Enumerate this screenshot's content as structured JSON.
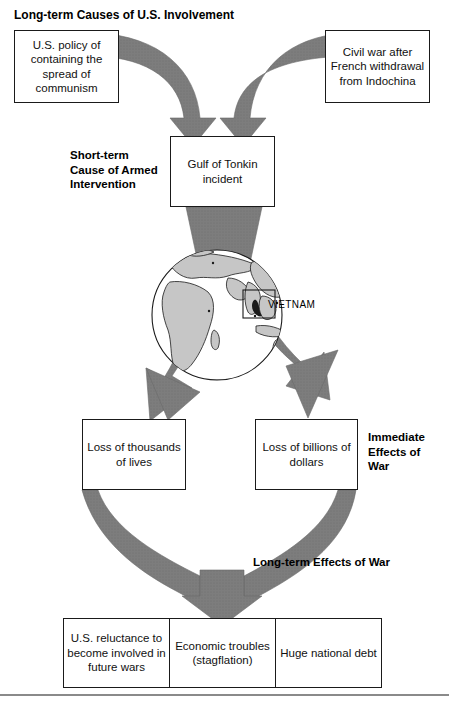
{
  "diagram": {
    "title": "Long-term Causes of U.S. Involvement",
    "section_labels": {
      "short_term_cause": "Short-term\nCause of Armed\nIntervention",
      "immediate_effects": "Immediate\nEffects of\nWar",
      "long_term_effects": "Long-term Effects of War"
    },
    "causes": [
      {
        "id": "cause-left",
        "text": "U.S. policy of containing the spread of communism"
      },
      {
        "id": "cause-right",
        "text": "Civil war after French withdrawal from Indochina"
      }
    ],
    "short_term_cause_box": {
      "id": "gulf-of-tonkin",
      "text": "Gulf of Tonkin incident"
    },
    "globe": {
      "region_label": "VIETNAM",
      "ocean_color": "#ffffff",
      "land_color": "#c6c6c6",
      "outline_color": "#1a1a1a"
    },
    "immediate_effects": [
      {
        "id": "loss-of-lives",
        "text": "Loss of thousands of lives"
      },
      {
        "id": "loss-of-dollars",
        "text": "Loss of billions of dollars"
      }
    ],
    "long_term_effects": [
      {
        "id": "effect-reluctance",
        "text": "U.S. reluctance to become involved in future wars"
      },
      {
        "id": "effect-economy",
        "text": "Economic troubles (stagflation)"
      },
      {
        "id": "effect-debt",
        "text": "Huge national debt"
      }
    ],
    "colors": {
      "arrow_fill": "#7d7d7d",
      "arrow_stroke": "#6a6a6a",
      "box_border": "#1a1a1a",
      "text": "#111111",
      "rule": "#8a8a8a"
    }
  }
}
